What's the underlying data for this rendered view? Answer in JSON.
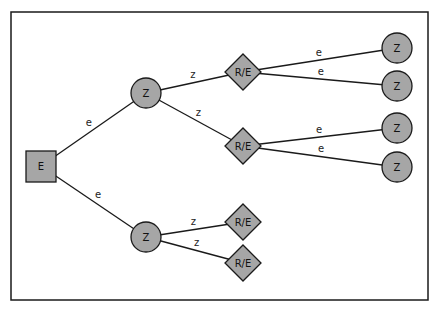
{
  "diagram": {
    "type": "decision-tree",
    "colors": {
      "node_fill": "#a6a6a6",
      "stroke": "#1a1a1a",
      "background": "#ffffff"
    },
    "nodes": [
      {
        "id": "root",
        "shape": "square",
        "label": "E",
        "x": 41,
        "y": 166
      },
      {
        "id": "z1",
        "shape": "circle",
        "label": "Z",
        "x": 146,
        "y": 93
      },
      {
        "id": "z2",
        "shape": "circle",
        "label": "Z",
        "x": 146,
        "y": 237
      },
      {
        "id": "re1",
        "shape": "diamond",
        "label": "R/E",
        "x": 243,
        "y": 72
      },
      {
        "id": "re2",
        "shape": "diamond",
        "label": "R/E",
        "x": 243,
        "y": 146
      },
      {
        "id": "re3",
        "shape": "diamond",
        "label": "R/E",
        "x": 243,
        "y": 222
      },
      {
        "id": "re4",
        "shape": "diamond",
        "label": "R/E",
        "x": 243,
        "y": 263
      },
      {
        "id": "z3",
        "shape": "circle",
        "label": "Z",
        "x": 397,
        "y": 48
      },
      {
        "id": "z4",
        "shape": "circle",
        "label": "Z",
        "x": 397,
        "y": 86
      },
      {
        "id": "z5",
        "shape": "circle",
        "label": "Z",
        "x": 397,
        "y": 128
      },
      {
        "id": "z6",
        "shape": "circle",
        "label": "Z",
        "x": 397,
        "y": 167
      }
    ],
    "edges": [
      {
        "from": "root",
        "to": "z1",
        "label": "e"
      },
      {
        "from": "root",
        "to": "z2",
        "label": "e"
      },
      {
        "from": "z1",
        "to": "re1",
        "label": "z"
      },
      {
        "from": "z1",
        "to": "re2",
        "label": "z"
      },
      {
        "from": "z2",
        "to": "re3",
        "label": "z"
      },
      {
        "from": "z2",
        "to": "re4",
        "label": "z"
      },
      {
        "from": "re1",
        "to": "z3",
        "label": "e"
      },
      {
        "from": "re1",
        "to": "z4",
        "label": "e"
      },
      {
        "from": "re2",
        "to": "z5",
        "label": "e"
      },
      {
        "from": "re2",
        "to": "z6",
        "label": "e"
      }
    ]
  }
}
